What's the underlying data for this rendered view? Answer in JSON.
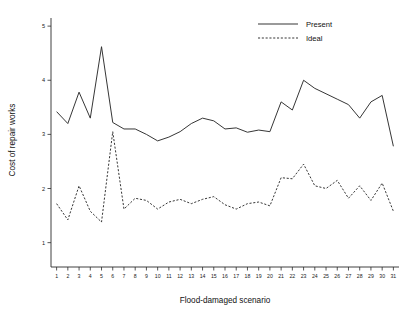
{
  "chart_data": {
    "type": "line",
    "title": "",
    "xlabel": "Flood-damaged scenario",
    "ylabel": "Cost of repair works",
    "xlim": [
      0.5,
      31.5
    ],
    "ylim": [
      0.55,
      5.15
    ],
    "yticks": [
      1,
      2,
      3,
      4,
      5
    ],
    "ytick_labels": [
      "1",
      "2",
      "3",
      "4",
      "5"
    ],
    "grid": false,
    "legend_position": "top-right",
    "x": [
      1,
      2,
      3,
      4,
      5,
      6,
      7,
      8,
      9,
      10,
      11,
      12,
      13,
      14,
      15,
      16,
      17,
      18,
      19,
      20,
      21,
      22,
      23,
      24,
      25,
      26,
      27,
      28,
      29,
      30,
      31
    ],
    "xtick_labels": [
      "1",
      "2",
      "3",
      "4",
      "5",
      "6",
      "7",
      "8",
      "9",
      "10",
      "11",
      "12",
      "13",
      "14",
      "15",
      "16",
      "17",
      "18",
      "19",
      "20",
      "21",
      "22",
      "23",
      "24",
      "25",
      "26",
      "27",
      "28",
      "29",
      "30",
      "31"
    ],
    "series": [
      {
        "name": "Present",
        "style": "solid",
        "color": "#2b2b2b",
        "values": [
          3.42,
          3.2,
          3.78,
          3.3,
          4.62,
          3.22,
          3.1,
          3.1,
          3.0,
          2.88,
          2.95,
          3.05,
          3.2,
          3.3,
          3.25,
          3.1,
          3.12,
          3.04,
          3.08,
          3.05,
          3.6,
          3.45,
          4.0,
          3.85,
          3.75,
          3.65,
          3.55,
          3.3,
          3.6,
          3.72,
          2.78
        ]
      },
      {
        "name": "Ideal",
        "style": "dashed",
        "color": "#2b2b2b",
        "values": [
          1.72,
          1.42,
          2.05,
          1.58,
          1.38,
          3.05,
          1.62,
          1.82,
          1.78,
          1.62,
          1.75,
          1.8,
          1.72,
          1.8,
          1.85,
          1.7,
          1.62,
          1.72,
          1.75,
          1.68,
          2.2,
          2.18,
          2.45,
          2.05,
          2.0,
          2.15,
          1.82,
          2.05,
          1.78,
          2.1,
          1.58
        ]
      }
    ]
  },
  "legend": {
    "entries": [
      {
        "label": "Present"
      },
      {
        "label": "Ideal"
      }
    ]
  },
  "axes": {
    "x_title": "Flood-damaged scenario",
    "y_title": "Cost of repair works"
  }
}
